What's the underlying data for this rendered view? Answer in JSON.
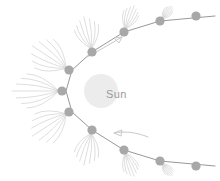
{
  "diagram": {
    "type": "comet-orbit-schematic",
    "background_color": "#ffffff",
    "canvas": {
      "width": 220,
      "height": 181
    }
  },
  "sun": {
    "label": "Sun",
    "center_x": 101,
    "center_y": 91,
    "radius": 17,
    "fill_color": "#ececec",
    "label_x": 106,
    "label_y": 95,
    "label_color": "#9a9a9a"
  },
  "orbit": {
    "name": "elliptical-comet-orbit",
    "stroke_color": "#8c8c8c",
    "stroke_width": 0.9,
    "path": "M 215 16 L 160 21 L 124 32 L 92 52 L 72 70 L 66 91 L 72 112 L 92 130 L 124 150 L 160 161 L 215 166",
    "perihelion_x": 66,
    "perihelion_y": 91
  },
  "nucleus_style": {
    "fill_color": "#a8a8a8",
    "radius": 4.6
  },
  "tail_style": {
    "stroke_color": "#d3d3d3",
    "stroke_width": 0.8,
    "filament_count": 7
  },
  "comets": [
    {
      "id": "c1",
      "label": "aphelion-inbound",
      "x": 196,
      "y": 16,
      "tail_length": 0,
      "tail_spread": 0,
      "has_tail": false
    },
    {
      "id": "c2",
      "label": "inbound-far",
      "x": 160,
      "y": 21,
      "tail_length": 19,
      "tail_spread": 17,
      "has_tail": true
    },
    {
      "id": "c3",
      "label": "inbound-mid",
      "x": 124,
      "y": 32,
      "tail_length": 28,
      "tail_spread": 21,
      "has_tail": true
    },
    {
      "id": "c4",
      "label": "inbound-near",
      "x": 92,
      "y": 52,
      "tail_length": 36,
      "tail_spread": 26,
      "has_tail": true
    },
    {
      "id": "c5",
      "label": "pre-perihelion",
      "x": 69,
      "y": 70,
      "tail_length": 44,
      "tail_spread": 30,
      "has_tail": true
    },
    {
      "id": "c6",
      "label": "perihelion",
      "x": 62,
      "y": 91,
      "tail_length": 50,
      "tail_spread": 26,
      "has_tail": true
    },
    {
      "id": "c7",
      "label": "post-perihelion",
      "x": 69,
      "y": 112,
      "tail_length": 44,
      "tail_spread": 30,
      "has_tail": true
    },
    {
      "id": "c8",
      "label": "outbound-near",
      "x": 92,
      "y": 130,
      "tail_length": 36,
      "tail_spread": 26,
      "has_tail": true
    },
    {
      "id": "c9",
      "label": "outbound-mid",
      "x": 124,
      "y": 150,
      "tail_length": 28,
      "tail_spread": 21,
      "has_tail": true
    },
    {
      "id": "c10",
      "label": "outbound-far",
      "x": 160,
      "y": 161,
      "tail_length": 19,
      "tail_spread": 17,
      "has_tail": true
    },
    {
      "id": "c11",
      "label": "aphelion-outbound",
      "x": 196,
      "y": 166,
      "tail_length": 0,
      "tail_spread": 0,
      "has_tail": false
    }
  ],
  "direction_arrows": [
    {
      "id": "arrow-upper",
      "label": "orbital-direction-inbound",
      "path": "M 87 57 C 97 52, 110 44, 122 37",
      "head": "M 122 37 L 114 38 L 119 43 Z",
      "stroke_color": "#c9c9c9",
      "stroke_width": 1.0,
      "points": "up-right"
    },
    {
      "id": "arrow-lower",
      "label": "orbital-direction-outbound",
      "path": "M 148 137 C 136 132, 124 131, 114 133",
      "head": "M 114 133 L 122 130 L 121 136 Z",
      "stroke_color": "#c9c9c9",
      "stroke_width": 1.0,
      "points": "left"
    }
  ]
}
